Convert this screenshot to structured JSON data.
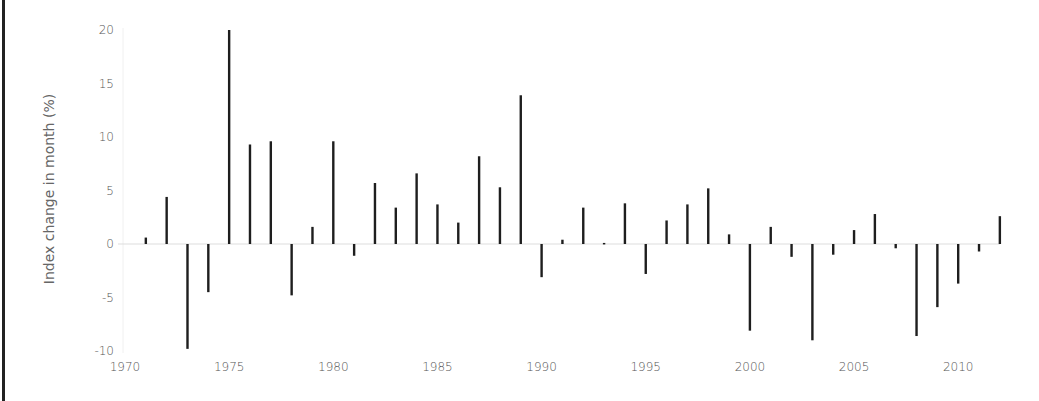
{
  "chart_data": {
    "type": "bar",
    "title": "",
    "xlabel": "",
    "ylabel": "Index change in month (%)",
    "ylim": [
      -10,
      20
    ],
    "xlim": [
      1970,
      2012
    ],
    "grid": false,
    "legend": null,
    "y_ticks": [
      20,
      15,
      10,
      5,
      0,
      -5,
      -10
    ],
    "x_ticks": [
      1970,
      1975,
      1980,
      1985,
      1990,
      1995,
      2000,
      2005,
      2010
    ],
    "categories": [
      1971,
      1972,
      1973,
      1974,
      1975,
      1976,
      1977,
      1978,
      1979,
      1980,
      1981,
      1982,
      1983,
      1984,
      1985,
      1986,
      1987,
      1988,
      1989,
      1990,
      1991,
      1992,
      1993,
      1994,
      1995,
      1996,
      1997,
      1998,
      1999,
      2000,
      2001,
      2002,
      2003,
      2004,
      2005,
      2006,
      2007,
      2008,
      2009,
      2010,
      2011,
      2012
    ],
    "values": [
      0.6,
      4.4,
      -9.8,
      -4.5,
      20.0,
      9.3,
      9.6,
      -4.8,
      1.6,
      9.6,
      -1.1,
      5.7,
      3.4,
      6.6,
      3.7,
      2.0,
      8.2,
      5.3,
      13.9,
      -3.1,
      0.4,
      3.4,
      0.1,
      3.8,
      -2.8,
      2.2,
      3.7,
      5.2,
      0.9,
      -8.1,
      1.6,
      -1.2,
      -9.0,
      -1.0,
      1.3,
      2.8,
      -0.4,
      -8.6,
      -5.9,
      -3.7,
      -0.7,
      2.6
    ]
  }
}
